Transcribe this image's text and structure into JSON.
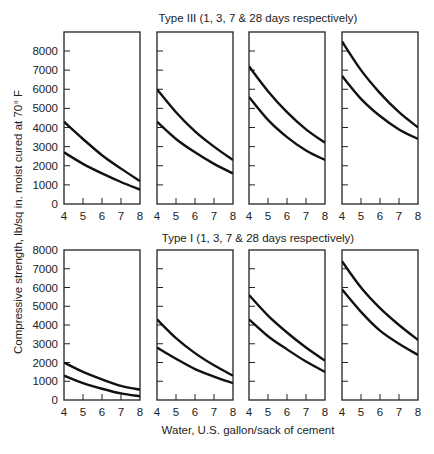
{
  "chart_data": {
    "type": "line",
    "title": "",
    "xlabel": "Water, U.S. gallon/sack of cement",
    "ylabel": "Compressive strength, lb/sq in. moist cured at 70° F",
    "xlim": [
      4,
      8
    ],
    "ylim": [
      0,
      8000
    ],
    "x_ticks": [
      "4",
      "5",
      "6",
      "7",
      "8"
    ],
    "y_ticks": [
      "0",
      "1000",
      "2000",
      "3000",
      "4000",
      "5000",
      "6000",
      "7000",
      "8000"
    ],
    "grid": false,
    "rows": [
      {
        "title": "Type III (1, 3, 7 & 28 days respectively)",
        "panels": [
          {
            "age": "1 day",
            "series": [
              {
                "name": "upper",
                "x": [
                  4,
                  5,
                  6,
                  7,
                  8
                ],
                "values": [
                  4300,
                  3400,
                  2550,
                  1850,
                  1200
                ]
              },
              {
                "name": "lower",
                "x": [
                  4,
                  5,
                  6,
                  7,
                  8
                ],
                "values": [
                  2700,
                  2100,
                  1600,
                  1150,
                  750
                ]
              }
            ]
          },
          {
            "age": "3 days",
            "series": [
              {
                "name": "upper",
                "x": [
                  4,
                  5,
                  6,
                  7,
                  8
                ],
                "values": [
                  6000,
                  4800,
                  3800,
                  3000,
                  2300
                ]
              },
              {
                "name": "lower",
                "x": [
                  4,
                  5,
                  6,
                  7,
                  8
                ],
                "values": [
                  4300,
                  3400,
                  2700,
                  2100,
                  1600
                ]
              }
            ]
          },
          {
            "age": "7 days",
            "series": [
              {
                "name": "upper",
                "x": [
                  4,
                  5,
                  6,
                  7,
                  8
                ],
                "values": [
                  7200,
                  5900,
                  4800,
                  3900,
                  3200
                ]
              },
              {
                "name": "lower",
                "x": [
                  4,
                  5,
                  6,
                  7,
                  8
                ],
                "values": [
                  5600,
                  4400,
                  3500,
                  2800,
                  2300
                ]
              }
            ]
          },
          {
            "age": "28 days",
            "series": [
              {
                "name": "upper",
                "x": [
                  4,
                  5,
                  6,
                  7,
                  8
                ],
                "values": [
                  8500,
                  7000,
                  5800,
                  4800,
                  4000
                ]
              },
              {
                "name": "lower",
                "x": [
                  4,
                  5,
                  6,
                  7,
                  8
                ],
                "values": [
                  6700,
                  5500,
                  4600,
                  3900,
                  3400
                ]
              }
            ]
          }
        ]
      },
      {
        "title": "Type I (1, 3, 7 & 28 days respectively)",
        "panels": [
          {
            "age": "1 day",
            "series": [
              {
                "name": "upper",
                "x": [
                  4,
                  5,
                  6,
                  7,
                  8
                ],
                "values": [
                  2000,
                  1500,
                  1100,
                  750,
                  550
                ]
              },
              {
                "name": "lower",
                "x": [
                  4,
                  5,
                  6,
                  7,
                  8
                ],
                "values": [
                  1300,
                  900,
                  600,
                  350,
                  200
                ]
              }
            ]
          },
          {
            "age": "3 days",
            "series": [
              {
                "name": "upper",
                "x": [
                  4,
                  5,
                  6,
                  7,
                  8
                ],
                "values": [
                  4300,
                  3300,
                  2500,
                  1850,
                  1300
                ]
              },
              {
                "name": "lower",
                "x": [
                  4,
                  5,
                  6,
                  7,
                  8
                ],
                "values": [
                  2800,
                  2200,
                  1650,
                  1250,
                  900
                ]
              }
            ]
          },
          {
            "age": "7 days",
            "series": [
              {
                "name": "upper",
                "x": [
                  4,
                  5,
                  6,
                  7,
                  8
                ],
                "values": [
                  5600,
                  4500,
                  3600,
                  2800,
                  2100
                ]
              },
              {
                "name": "lower",
                "x": [
                  4,
                  5,
                  6,
                  7,
                  8
                ],
                "values": [
                  4300,
                  3400,
                  2700,
                  2050,
                  1500
                ]
              }
            ]
          },
          {
            "age": "28 days",
            "series": [
              {
                "name": "upper",
                "x": [
                  4,
                  5,
                  6,
                  7,
                  8
                ],
                "values": [
                  7400,
                  6000,
                  4900,
                  4000,
                  3200
                ]
              },
              {
                "name": "lower",
                "x": [
                  4,
                  5,
                  6,
                  7,
                  8
                ],
                "values": [
                  5900,
                  4700,
                  3700,
                  3000,
                  2400
                ]
              }
            ]
          }
        ]
      }
    ]
  },
  "colors": {
    "line": "#111111",
    "frame": "#222222",
    "text": "#222222",
    "background": "#ffffff"
  }
}
